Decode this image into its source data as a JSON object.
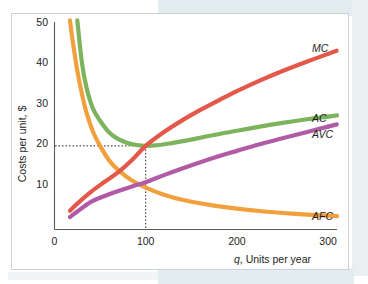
{
  "chart_data": {
    "type": "line",
    "title": "",
    "xlabel": "q, Units per year",
    "ylabel": "Costs per unit, $",
    "xlim": [
      0,
      310
    ],
    "ylim": [
      0,
      52
    ],
    "xticks": [
      "0",
      "100",
      "200",
      "300"
    ],
    "xtick_values": [
      0,
      100,
      200,
      300
    ],
    "yticks": [
      "10",
      "20",
      "30",
      "40",
      "50"
    ],
    "ytick_values": [
      10,
      20,
      30,
      40,
      50
    ],
    "grid": false,
    "legend_position": "right-of-curve-ends",
    "annotations": {
      "min_ac_point": {
        "q": 100,
        "cost": 20,
        "style": "dotted-guide-lines"
      }
    },
    "series": [
      {
        "name": "MC",
        "label": "MC",
        "color": "#e4584a",
        "x": [
          17,
          25,
          40,
          55,
          70,
          85,
          100,
          120,
          140,
          160,
          180,
          200,
          225,
          250,
          275,
          300
        ],
        "values": [
          4.5,
          6.2,
          9.0,
          11.4,
          13.7,
          16.6,
          20.0,
          23.3,
          26.1,
          28.6,
          30.9,
          33.1,
          35.6,
          37.9,
          40.0,
          42.0
        ]
      },
      {
        "name": "AC",
        "label": "AC",
        "color": "#7cb35c",
        "x": [
          25,
          30,
          35,
          42,
          50,
          60,
          70,
          80,
          90,
          100,
          115,
          130,
          150,
          175,
          200,
          225,
          250,
          275,
          300
        ],
        "values": [
          50.0,
          40.0,
          34.0,
          29.0,
          26.0,
          23.2,
          21.6,
          20.7,
          20.2,
          20.0,
          20.2,
          20.7,
          21.5,
          22.6,
          23.6,
          24.6,
          25.5,
          26.3,
          27.0
        ]
      },
      {
        "name": "AVC",
        "label": "AVC",
        "color": "#b15ba6",
        "x": [
          17,
          25,
          40,
          55,
          70,
          85,
          100,
          120,
          140,
          160,
          180,
          200,
          225,
          250,
          275,
          300
        ],
        "values": [
          3.0,
          4.3,
          6.6,
          8.0,
          9.2,
          10.3,
          11.3,
          13.0,
          14.6,
          16.1,
          17.5,
          18.8,
          20.4,
          21.8,
          23.2,
          24.6
        ]
      },
      {
        "name": "AFC",
        "label": "AFC",
        "color": "#f2a03e",
        "x": [
          17,
          20,
          25,
          30,
          35,
          42,
          50,
          60,
          70,
          85,
          100,
          120,
          140,
          170,
          200,
          230,
          260,
          300
        ],
        "values": [
          50.0,
          45.0,
          38.0,
          32.5,
          28.0,
          23.5,
          20.0,
          16.5,
          14.2,
          11.7,
          10.0,
          8.3,
          7.1,
          5.9,
          5.0,
          4.3,
          3.8,
          3.3
        ]
      }
    ]
  },
  "axes": {
    "y_title": "Costs per unit, $",
    "x_title_italic": "q",
    "x_title_rest": ", Units per year"
  },
  "tick_labels": {
    "y": [
      "50",
      "40",
      "30",
      "20",
      "10"
    ],
    "x": [
      "0",
      "100",
      "200",
      "300"
    ]
  },
  "curve_labels": {
    "mc": "MC",
    "ac": "AC",
    "avc": "AVC",
    "afc": "AFC"
  },
  "colors": {
    "mc": "#e4584a",
    "ac": "#7cb35c",
    "avc": "#b15ba6",
    "afc": "#f2a03e",
    "axis": "#555b5e",
    "card_border": "#c9d2d6",
    "page_band": "#e3edf0"
  }
}
